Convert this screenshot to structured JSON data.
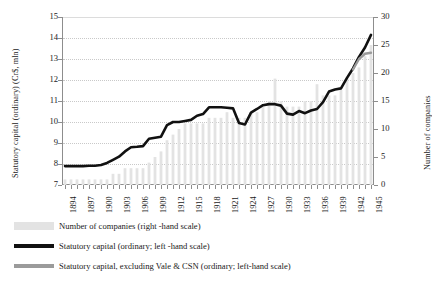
{
  "chart_data": {
    "type": "bar",
    "title": "",
    "xlabel": "",
    "ylabel": "Statutory capital (ordinary) (Cr$, mln)",
    "y2label": "Number of companies",
    "ylim": [
      7,
      15
    ],
    "y2lim": [
      0,
      30
    ],
    "yticks": [
      7,
      8,
      9,
      10,
      11,
      12,
      13,
      14,
      15
    ],
    "y2ticks": [
      0,
      5,
      10,
      15,
      20,
      25,
      30
    ],
    "grid": true,
    "legend_position": "below",
    "xtick_labels": [
      "1894",
      "1897",
      "1900",
      "1903",
      "1906",
      "1909",
      "1912",
      "1915",
      "1918",
      "1921",
      "1924",
      "1927",
      "1930",
      "1933",
      "1936",
      "1939",
      "1942",
      "1945"
    ],
    "xtick_step_years": 3,
    "x": [
      1894,
      1895,
      1896,
      1897,
      1898,
      1899,
      1900,
      1901,
      1902,
      1903,
      1904,
      1905,
      1906,
      1907,
      1908,
      1909,
      1910,
      1911,
      1912,
      1913,
      1914,
      1915,
      1916,
      1917,
      1918,
      1919,
      1920,
      1921,
      1922,
      1923,
      1924,
      1925,
      1926,
      1927,
      1928,
      1929,
      1930,
      1931,
      1932,
      1933,
      1934,
      1935,
      1936,
      1937,
      1938,
      1939,
      1940,
      1941,
      1942,
      1943,
      1944,
      1945
    ],
    "series": [
      {
        "name": "Number of companies (right -hand scale)",
        "type": "bar",
        "axis": "right",
        "color": "#e3e3e3",
        "values": [
          1,
          1,
          1,
          1,
          1,
          1,
          1,
          1,
          2,
          2,
          3,
          3,
          3,
          3,
          4,
          5,
          6,
          8,
          9,
          10,
          11,
          11,
          11,
          11,
          12,
          12,
          12,
          13,
          12,
          12,
          12,
          13,
          13,
          14,
          15,
          19,
          15,
          14,
          14,
          14,
          15,
          15,
          18,
          16,
          16,
          16,
          17,
          19,
          20,
          21,
          23,
          25
        ]
      },
      {
        "name": "Statutory capital (ordinary; left -hand scale)",
        "type": "line",
        "axis": "left",
        "color": "#111111",
        "values": [
          7.9,
          7.9,
          7.9,
          7.9,
          7.92,
          7.92,
          7.95,
          8.05,
          8.2,
          8.35,
          8.6,
          8.8,
          8.82,
          8.85,
          9.2,
          9.25,
          9.3,
          9.85,
          10.0,
          10.0,
          10.05,
          10.1,
          10.3,
          10.38,
          10.7,
          10.7,
          10.7,
          10.68,
          10.65,
          9.95,
          9.88,
          10.45,
          10.62,
          10.8,
          10.85,
          10.85,
          10.78,
          10.4,
          10.35,
          10.52,
          10.42,
          10.55,
          10.62,
          10.95,
          11.45,
          11.55,
          11.6,
          12.1,
          12.55,
          13.1,
          13.55,
          14.15
        ]
      },
      {
        "name": "Statutory capital, excluding Vale & CSN (ordinary; left-hand scale)",
        "type": "line",
        "axis": "left",
        "color": "#9b9b9b",
        "values": [
          null,
          null,
          null,
          null,
          null,
          null,
          null,
          null,
          null,
          null,
          null,
          null,
          null,
          null,
          null,
          null,
          null,
          null,
          null,
          null,
          null,
          null,
          null,
          null,
          null,
          null,
          null,
          null,
          null,
          null,
          null,
          null,
          null,
          null,
          null,
          null,
          null,
          null,
          null,
          null,
          null,
          null,
          null,
          null,
          null,
          null,
          null,
          null,
          12.5,
          13.0,
          13.25,
          13.3
        ]
      }
    ]
  },
  "legend": {
    "items": [
      {
        "label": "Number of companies (right -hand scale)",
        "swatch": "bar"
      },
      {
        "label": "Statutory capital (ordinary; left -hand scale)",
        "swatch": "black"
      },
      {
        "label": "Statutory capital, excluding Vale & CSN (ordinary; left-hand scale)",
        "swatch": "gray"
      }
    ]
  }
}
